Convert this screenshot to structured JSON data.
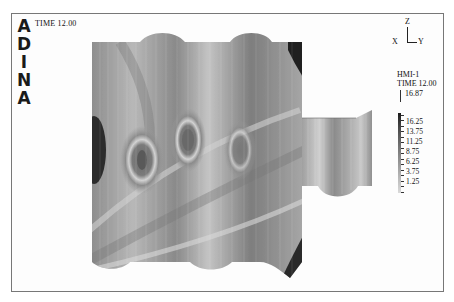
{
  "logo": {
    "letters": [
      "A",
      "D",
      "I",
      "N",
      "A"
    ]
  },
  "header": {
    "time_label": "TIME 12.00"
  },
  "axes_triad": {
    "z": "Z",
    "x": "X",
    "y": "Y"
  },
  "legend": {
    "variable": "HMI-1",
    "time_label": "TIME 12.00",
    "max_value": "16.87",
    "levels": [
      "16.25",
      "13.75",
      "11.25",
      "8.75",
      "6.25",
      "3.75",
      "1.25"
    ],
    "colors": {
      "high": "#1a1a1a",
      "low": "#dadada"
    }
  },
  "plot": {
    "description": "Grayscale contour band plot of wave field over harbor/basin mesh with attached side channel",
    "colors": {
      "dark": "#2a2a2a",
      "mid": "#8a8a8a",
      "light": "#d8d8d8"
    }
  }
}
